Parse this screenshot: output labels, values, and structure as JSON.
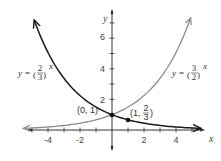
{
  "chart_data": {
    "type": "line",
    "title": "",
    "xlabel": "x",
    "ylabel": "y",
    "xlim": [
      -5.5,
      5.7
    ],
    "ylim": [
      -1.2,
      7.4
    ],
    "x_ticks": [
      -4,
      -2,
      2,
      4
    ],
    "y_ticks": [
      2,
      4,
      6
    ],
    "grid": false,
    "series": [
      {
        "name": "y = (2/3)^x",
        "color": "#1a1a1a",
        "function": "(2/3)^x",
        "x": [
          -4.85,
          -4,
          -3,
          -2,
          -1,
          0,
          1,
          2,
          3,
          4,
          5,
          5.5
        ],
        "values": [
          7.14,
          5.06,
          3.38,
          2.25,
          1.5,
          1,
          0.667,
          0.444,
          0.296,
          0.198,
          0.132,
          0.108
        ]
      },
      {
        "name": "y = (3/2)^x",
        "color": "#8c8c8c",
        "function": "(3/2)^x",
        "x": [
          -5.5,
          -5,
          -4,
          -3,
          -2,
          -1,
          0,
          1,
          2,
          3,
          4,
          4.9
        ],
        "values": [
          0.108,
          0.132,
          0.198,
          0.296,
          0.444,
          0.667,
          1,
          1.5,
          2.25,
          3.38,
          5.06,
          7.3
        ]
      }
    ],
    "annotations": [
      {
        "text": "(0, 1)",
        "x": 0,
        "y": 1
      },
      {
        "text": "(1, 2/3)",
        "x": 1,
        "y": 0.667
      }
    ]
  },
  "labels": {
    "x_axis": "x",
    "y_axis": "y",
    "x_ticks": [
      "-4",
      "-2",
      "2",
      "4"
    ],
    "y_ticks": [
      "6",
      "4",
      "2"
    ],
    "eq_left": {
      "prefix": "y = ",
      "num": "2",
      "den": "3",
      "exp": "x"
    },
    "eq_right": {
      "prefix": "y = ",
      "num": "3",
      "den": "2",
      "exp": "x"
    },
    "point_a": "(0, 1)",
    "point_b_prefix": "(1, ",
    "point_b_num": "2",
    "point_b_den": "3",
    "point_b_suffix": ")"
  },
  "colors": {
    "curve_dark": "#1a1a1a",
    "curve_light": "#8c8c8c",
    "axis": "#333333"
  }
}
